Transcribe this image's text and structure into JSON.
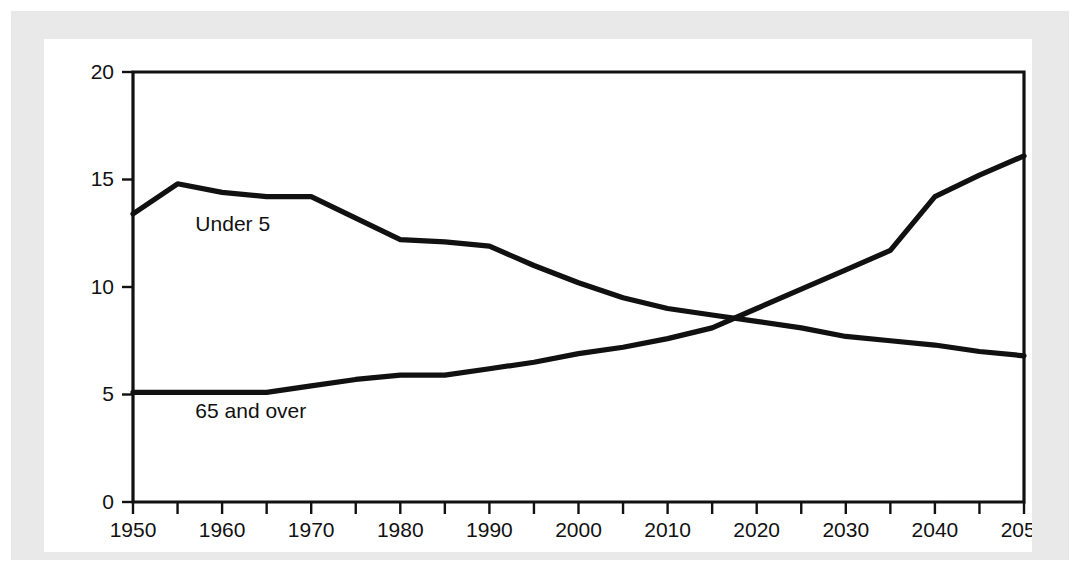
{
  "chart_data": {
    "type": "line",
    "title": "",
    "xlabel": "",
    "ylabel": "",
    "xlim": [
      1950,
      2050
    ],
    "ylim": [
      0,
      20
    ],
    "x_tick_labels": [
      "1950",
      "1960",
      "1970",
      "1980",
      "1990",
      "2000",
      "2010",
      "2020",
      "2030",
      "2040",
      "2050"
    ],
    "x_tick_values": [
      1950,
      1960,
      1970,
      1980,
      1990,
      2000,
      2010,
      2020,
      2030,
      2040,
      2050
    ],
    "x_minor_tick_values": [
      1950,
      1955,
      1960,
      1965,
      1970,
      1975,
      1980,
      1985,
      1990,
      1995,
      2000,
      2005,
      2010,
      2015,
      2020,
      2025,
      2030,
      2035,
      2040,
      2045,
      2050
    ],
    "y_tick_labels": [
      "0",
      "5",
      "10",
      "15",
      "20"
    ],
    "y_tick_values": [
      0,
      5,
      10,
      15,
      20
    ],
    "grid": false,
    "legend_position": "inline-annotation",
    "line_color": "#111111",
    "x": [
      1950,
      1955,
      1960,
      1965,
      1970,
      1975,
      1980,
      1985,
      1990,
      1995,
      2000,
      2005,
      2010,
      2015,
      2020,
      2025,
      2030,
      2035,
      2040,
      2045,
      2050
    ],
    "series": [
      {
        "name": "Under 5",
        "label": "Under 5",
        "label_x": 1957,
        "label_y": 12.6,
        "values": [
          13.4,
          14.8,
          14.4,
          14.2,
          14.2,
          13.2,
          12.2,
          12.1,
          11.9,
          11.0,
          10.2,
          9.5,
          9.0,
          8.7,
          8.4,
          8.1,
          7.7,
          7.5,
          7.3,
          7.0,
          6.8
        ]
      },
      {
        "name": "65 and over",
        "label": "65 and over",
        "label_x": 1957,
        "label_y": 3.9,
        "values": [
          5.1,
          5.1,
          5.1,
          5.1,
          5.4,
          5.7,
          5.9,
          5.9,
          6.2,
          6.5,
          6.9,
          7.2,
          7.6,
          8.1,
          9.0,
          9.9,
          10.8,
          11.7,
          14.2,
          15.2,
          16.1
        ]
      }
    ],
    "crossover": {
      "x": 2016,
      "y": 8.6
    }
  }
}
